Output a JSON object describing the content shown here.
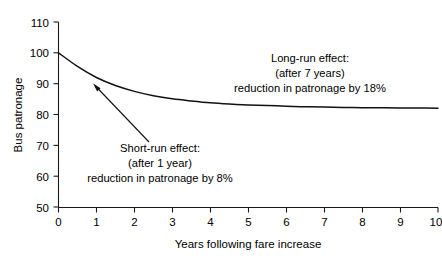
{
  "chart_data": {
    "type": "line",
    "title": "",
    "xlabel": "Years following fare increase",
    "ylabel": "Bus patronage",
    "xlim": [
      0,
      10
    ],
    "ylim": [
      50,
      110
    ],
    "grid": false,
    "legend": "none",
    "x_ticks": [
      "0",
      "1",
      "2",
      "3",
      "4",
      "5",
      "6",
      "7",
      "8",
      "9",
      "10"
    ],
    "y_ticks": [
      "50",
      "60",
      "70",
      "80",
      "90",
      "100",
      "110"
    ],
    "series": [
      {
        "name": "Bus patronage",
        "x": [
          0,
          0.5,
          1,
          1.5,
          2,
          2.5,
          3,
          3.5,
          4,
          4.5,
          5,
          5.5,
          6,
          6.5,
          7,
          7.5,
          8,
          8.5,
          9,
          9.5,
          10
        ],
        "values": [
          100,
          95.6,
          92.0,
          89.4,
          87.5,
          86.1,
          85.1,
          84.4,
          83.8,
          83.4,
          83.1,
          82.9,
          82.7,
          82.5,
          82.4,
          82.3,
          82.2,
          82.2,
          82.1,
          82.1,
          82.0
        ]
      }
    ],
    "annotations": [
      {
        "id": "short-run",
        "lines": [
          "Short-run effect:",
          "(after 1 year)",
          "reduction in patronage by 8%"
        ],
        "points_to_x": 1.0,
        "points_to_y": 92
      },
      {
        "id": "long-run",
        "lines": [
          "Long-run effect:",
          "(after 7 years)",
          "reduction in patronage by 18%"
        ],
        "points_to_x": 7.0,
        "points_to_y": 82.4
      }
    ]
  }
}
